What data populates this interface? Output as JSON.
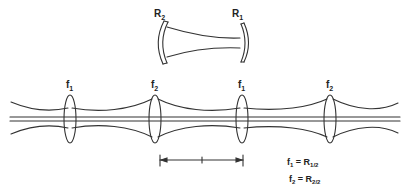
{
  "cavity": {
    "mirror_left_label": "R",
    "mirror_left_sub": "2",
    "mirror_right_label": "R",
    "mirror_right_sub": "1"
  },
  "lenses": [
    {
      "label": "f",
      "sub": "1"
    },
    {
      "label": "f",
      "sub": "2"
    },
    {
      "label": "f",
      "sub": "1"
    },
    {
      "label": "f",
      "sub": "2"
    }
  ],
  "equations": [
    {
      "lhs": "f",
      "lhs_sub": "1",
      "eq": " = R",
      "rhs_sub": "1/2"
    },
    {
      "lhs": "f",
      "lhs_sub": "2",
      "eq": " = R",
      "rhs_sub": "2/2"
    }
  ],
  "colors": {
    "stroke": "#333333",
    "background": "#ffffff"
  }
}
